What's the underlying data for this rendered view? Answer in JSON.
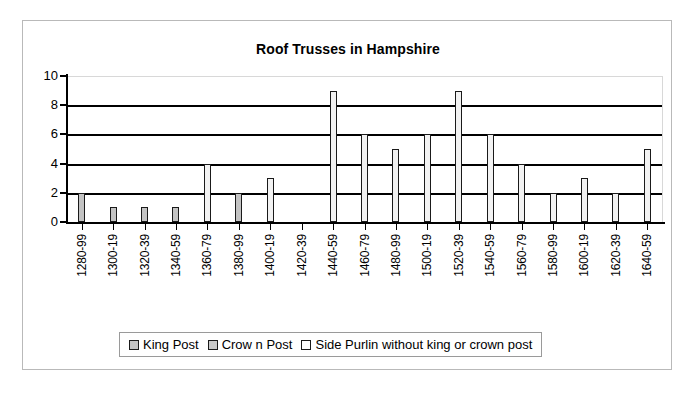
{
  "chart_data": {
    "type": "bar",
    "title": "Roof Trusses in Hampshire",
    "xlabel": "",
    "ylabel": "",
    "ylim": [
      0,
      10
    ],
    "yticks": [
      0,
      2,
      4,
      6,
      8,
      10
    ],
    "grid": true,
    "legend_position": "bottom",
    "categories": [
      "1280-99",
      "1300-19",
      "1320-39",
      "1340-59",
      "1360-79",
      "1380-99",
      "1400-19",
      "1420-39",
      "1440-59",
      "1460-79",
      "1480-99",
      "1500-19",
      "1520-39",
      "1540-59",
      "1560-79",
      "1580-99",
      "1600-19",
      "1620-39",
      "1640-59"
    ],
    "series": [
      {
        "name": "King Post",
        "color": "#c3c3c3",
        "values": [
          2,
          1,
          1,
          1,
          0,
          2,
          0,
          0,
          0,
          0,
          0,
          0,
          0,
          0,
          0,
          0,
          0,
          0,
          0
        ]
      },
      {
        "name": "Crow n Post",
        "color": "#c9c9c9",
        "values": [
          0,
          0,
          0,
          0,
          0,
          0,
          0,
          0,
          0,
          0,
          0,
          0,
          0,
          0,
          0,
          0,
          0,
          0,
          0
        ]
      },
      {
        "name": "Side Purlin without king or crown post",
        "color": "#ffffff",
        "values": [
          0,
          0,
          0,
          0,
          4,
          0,
          3,
          0,
          9,
          6,
          5,
          6,
          9,
          6,
          4,
          2,
          3,
          2,
          5
        ]
      }
    ]
  },
  "legend": {
    "items": [
      {
        "label": "King Post"
      },
      {
        "label": "Crow n Post"
      },
      {
        "label": "Side Purlin without king or crown post"
      }
    ]
  }
}
